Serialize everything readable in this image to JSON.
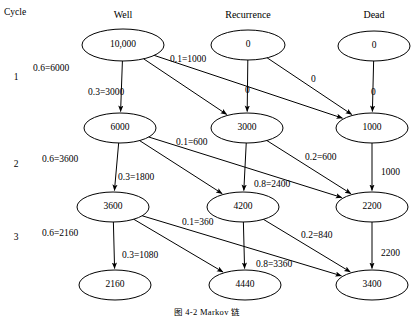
{
  "diagram": {
    "cycle_header": "Cycle",
    "caption": "图 4-2   Markov 链",
    "columns": [
      {
        "label": "Well",
        "x": 123
      },
      {
        "label": "Recurrence",
        "x": 248
      },
      {
        "label": "Dead",
        "x": 374
      }
    ],
    "cycle_numbers": [
      {
        "label": "1",
        "x": 16,
        "y": 73
      },
      {
        "label": "2",
        "x": 16,
        "y": 160
      },
      {
        "label": "3",
        "x": 16,
        "y": 233
      }
    ],
    "nodes": [
      {
        "id": "w0",
        "value": "10,000",
        "cx": 123,
        "cy": 45,
        "rx": 41,
        "ry": 16
      },
      {
        "id": "r0",
        "value": "0",
        "cx": 248,
        "cy": 45,
        "rx": 37,
        "ry": 15
      },
      {
        "id": "d0",
        "value": "0",
        "cx": 374,
        "cy": 46,
        "rx": 36,
        "ry": 15
      },
      {
        "id": "w1",
        "value": "6000",
        "cx": 120,
        "cy": 128,
        "rx": 36,
        "ry": 15
      },
      {
        "id": "r1",
        "value": "3000",
        "cx": 247,
        "cy": 128,
        "rx": 36,
        "ry": 15
      },
      {
        "id": "d1",
        "value": "1000",
        "cx": 372,
        "cy": 128,
        "rx": 36,
        "ry": 15
      },
      {
        "id": "w2",
        "value": "3600",
        "cx": 113,
        "cy": 207,
        "rx": 36,
        "ry": 15
      },
      {
        "id": "r2",
        "value": "4200",
        "cx": 243,
        "cy": 207,
        "rx": 36,
        "ry": 15
      },
      {
        "id": "d2",
        "value": "2200",
        "cx": 372,
        "cy": 207,
        "rx": 36,
        "ry": 15
      },
      {
        "id": "w3",
        "value": "2160",
        "cx": 115,
        "cy": 285,
        "rx": 36,
        "ry": 15
      },
      {
        "id": "r3",
        "value": "4440",
        "cx": 245,
        "cy": 285,
        "rx": 36,
        "ry": 15
      },
      {
        "id": "d3",
        "value": "3400",
        "cx": 372,
        "cy": 285,
        "rx": 36,
        "ry": 15
      }
    ],
    "edges": [
      {
        "from": "w0",
        "to": "w1",
        "label": "0.6=6000",
        "lx": 33,
        "ly": 64
      },
      {
        "from": "w0",
        "to": "r1",
        "label": "0.3=3000",
        "lx": 88,
        "ly": 88
      },
      {
        "from": "w0",
        "to": "d1",
        "label": "0.1=1000",
        "lx": 170,
        "ly": 55
      },
      {
        "from": "r0",
        "to": "r1",
        "label": "0",
        "lx": 245,
        "ly": 86
      },
      {
        "from": "r0",
        "to": "d1",
        "label": "0",
        "lx": 311,
        "ly": 75
      },
      {
        "from": "d0",
        "to": "d1",
        "label": "0",
        "lx": 371,
        "ly": 88
      },
      {
        "from": "w1",
        "to": "w2",
        "label": "0.6=3600",
        "lx": 42,
        "ly": 155
      },
      {
        "from": "w1",
        "to": "r2",
        "label": "0.3=1800",
        "lx": 118,
        "ly": 173
      },
      {
        "from": "w1",
        "to": "d2",
        "label": "0.1=600",
        "lx": 176,
        "ly": 138
      },
      {
        "from": "r1",
        "to": "r2",
        "label": "0.8=2400",
        "lx": 254,
        "ly": 180
      },
      {
        "from": "r1",
        "to": "d2",
        "label": "0.2=600",
        "lx": 305,
        "ly": 153
      },
      {
        "from": "d1",
        "to": "d2",
        "label": "1000",
        "lx": 381,
        "ly": 168
      },
      {
        "from": "w2",
        "to": "w3",
        "label": "0.6=2160",
        "lx": 42,
        "ly": 229
      },
      {
        "from": "w2",
        "to": "r3",
        "label": "0.3=1080",
        "lx": 122,
        "ly": 251
      },
      {
        "from": "w2",
        "to": "d3",
        "label": "0.1=360",
        "lx": 182,
        "ly": 218
      },
      {
        "from": "r2",
        "to": "r3",
        "label": "0.8=3360",
        "lx": 256,
        "ly": 260
      },
      {
        "from": "r2",
        "to": "d3",
        "label": "0.2=840",
        "lx": 301,
        "ly": 231
      },
      {
        "from": "d2",
        "to": "d3",
        "label": "2200",
        "lx": 381,
        "ly": 249
      }
    ]
  },
  "chart_data": {
    "type": "diagram",
    "states": [
      "Well",
      "Recurrence",
      "Dead"
    ],
    "cycles": [
      "1",
      "2",
      "3"
    ],
    "cohort_by_cycle": {
      "0": {
        "Well": 10000,
        "Recurrence": 0,
        "Dead": 0
      },
      "1": {
        "Well": 6000,
        "Recurrence": 3000,
        "Dead": 1000
      },
      "2": {
        "Well": 3600,
        "Recurrence": 4200,
        "Dead": 2200
      },
      "3": {
        "Well": 2160,
        "Recurrence": 4440,
        "Dead": 3400
      }
    },
    "transitions": {
      "Well": {
        "Well": 0.6,
        "Recurrence": 0.3,
        "Dead": 0.1
      },
      "Recurrence": {
        "Recurrence": 0.8,
        "Dead": 0.2
      },
      "Dead": {
        "Dead": 1.0
      }
    }
  }
}
